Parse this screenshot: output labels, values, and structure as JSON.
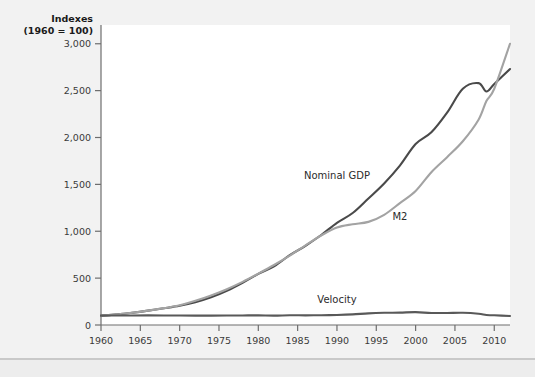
{
  "chart_data": {
    "type": "line",
    "title": "",
    "ylabel_line1": "Indexes",
    "ylabel_line2": "(1960 = 100)",
    "xlabel": "",
    "grid": false,
    "legend": "inline-annotations",
    "xlim": [
      1960,
      2012
    ],
    "ylim": [
      0,
      3200
    ],
    "yticks": [
      0,
      500,
      1000,
      1500,
      2000,
      2500,
      3000
    ],
    "ytick_labels": [
      "0",
      "500",
      "1,000",
      "1,500",
      "2,000",
      "2,500",
      "3,000"
    ],
    "xticks": [
      1960,
      1965,
      1970,
      1975,
      1980,
      1985,
      1990,
      1995,
      2000,
      2005,
      2010
    ],
    "xtick_labels": [
      "1960",
      "1965",
      "1970",
      "1975",
      "1980",
      "1985",
      "1990",
      "1995",
      "2000",
      "2005",
      "2010"
    ],
    "x": [
      1960,
      1962,
      1964,
      1966,
      1968,
      1970,
      1972,
      1974,
      1976,
      1978,
      1980,
      1982,
      1984,
      1986,
      1988,
      1990,
      1992,
      1994,
      1996,
      1998,
      2000,
      2002,
      2004,
      2006,
      2008,
      2009,
      2010,
      2012
    ],
    "series": [
      {
        "name": "Nominal GDP",
        "color": "#4a4a4a",
        "label_x": 1990,
        "label_y": 1560,
        "values": [
          100,
          113,
          131,
          153,
          178,
          205,
          243,
          295,
          365,
          450,
          545,
          625,
          745,
          845,
          960,
          1090,
          1195,
          1350,
          1510,
          1700,
          1930,
          2055,
          2265,
          2520,
          2580,
          2490,
          2570,
          2730
        ]
      },
      {
        "name": "M2",
        "color": "#a3a3a3",
        "label_x": 1998,
        "label_y": 1115,
        "values": [
          100,
          113,
          132,
          153,
          180,
          210,
          258,
          315,
          382,
          460,
          548,
          640,
          740,
          850,
          955,
          1040,
          1075,
          1100,
          1175,
          1300,
          1430,
          1630,
          1790,
          1960,
          2190,
          2390,
          2520,
          3000
        ]
      },
      {
        "name": "Velocity",
        "color": "#595959",
        "label_x": 1990,
        "label_y": 235,
        "values": [
          100,
          101,
          102,
          103,
          102,
          101,
          100,
          100,
          101,
          102,
          103,
          100,
          104,
          103,
          104,
          107,
          113,
          124,
          130,
          132,
          137,
          128,
          128,
          130,
          120,
          106,
          104,
          96
        ]
      }
    ]
  },
  "canvas": {
    "background": "#f2f2f2",
    "plot_background": "#ffffff",
    "axis_color": "#6e6e6e"
  }
}
